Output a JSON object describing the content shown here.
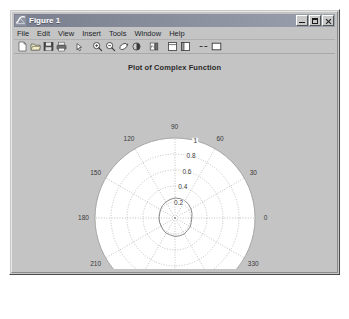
{
  "window": {
    "title": "Figure 1",
    "icon": "matlab-figure-icon",
    "buttons": {
      "minimize": "_",
      "maximize": "□",
      "close": "×"
    }
  },
  "menubar": {
    "items": [
      {
        "label": "File"
      },
      {
        "label": "Edit"
      },
      {
        "label": "View"
      },
      {
        "label": "Insert"
      },
      {
        "label": "Tools"
      },
      {
        "label": "Window"
      },
      {
        "label": "Help"
      }
    ]
  },
  "toolbar": {
    "buttons": [
      {
        "name": "new-figure-icon",
        "tip": "New Figure"
      },
      {
        "name": "open-file-icon",
        "tip": "Open File"
      },
      {
        "name": "save-figure-icon",
        "tip": "Save Figure"
      },
      {
        "name": "print-figure-icon",
        "tip": "Print Figure"
      },
      {
        "name": "edit-plot-icon",
        "tip": "Edit Plot"
      },
      {
        "name": "zoom-in-icon",
        "tip": "Zoom In"
      },
      {
        "name": "zoom-out-icon",
        "tip": "Zoom Out"
      },
      {
        "name": "rotate-3d-icon",
        "tip": "Rotate 3D"
      },
      {
        "name": "data-cursor-icon",
        "tip": "Data Cursor"
      },
      {
        "name": "insert-colorbar-icon",
        "tip": "Insert Colorbar"
      },
      {
        "name": "insert-legend-icon",
        "tip": "Insert Legend"
      },
      {
        "name": "hide-plot-tools-icon",
        "tip": "Hide Plot Tools"
      },
      {
        "name": "show-plot-tools-icon",
        "tip": "Show Plot Tools"
      }
    ]
  },
  "colors": {
    "figure_background": "#c4c4c4",
    "axes_background": "#ffffff",
    "grid": "#999999",
    "line": "#808080",
    "title_bar": "#8d92a0",
    "text": "#3a3a3a"
  },
  "chart_data": {
    "type": "line",
    "projection": "polar",
    "title": "Plot of Complex Function",
    "xlabel": "",
    "ylabel": "",
    "grid": true,
    "legend": null,
    "theta_unit": "degrees",
    "theta_ticks": [
      0,
      30,
      60,
      90,
      120,
      150,
      180,
      210,
      240,
      270,
      300,
      330
    ],
    "theta_tick_labels": [
      "0",
      "30",
      "60",
      "90",
      "120",
      "150",
      "180",
      "210",
      "240",
      "270",
      "300",
      "330"
    ],
    "r_ticks": [
      0.2,
      0.4,
      0.6,
      0.8,
      1
    ],
    "r_tick_labels": [
      "0.2",
      "0.4",
      "0.6",
      "0.8",
      "1"
    ],
    "rlim": [
      0,
      1
    ],
    "r_label_angle": 75,
    "series": [
      {
        "name": "complex function",
        "color": "#7d7d7d",
        "theta": [
          0,
          15,
          30,
          45,
          60,
          75,
          90,
          105,
          120,
          135,
          150,
          165,
          180,
          195,
          210,
          225,
          240,
          255,
          270,
          285,
          300,
          315,
          330,
          345,
          360
        ],
        "r": [
          0.21,
          0.22,
          0.23,
          0.24,
          0.25,
          0.25,
          0.25,
          0.24,
          0.23,
          0.22,
          0.21,
          0.2,
          0.2,
          0.2,
          0.2,
          0.21,
          0.22,
          0.22,
          0.23,
          0.23,
          0.23,
          0.22,
          0.22,
          0.21,
          0.21
        ]
      }
    ]
  }
}
